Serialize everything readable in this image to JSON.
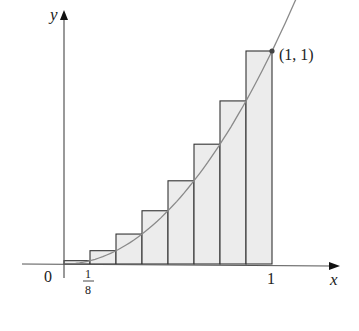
{
  "chart_data": {
    "type": "bar",
    "title": "",
    "function": "y = x^2",
    "xlabel": "x",
    "ylabel": "y",
    "xlim": [
      0,
      1
    ],
    "ylim": [
      0,
      1
    ],
    "n_rectangles": 8,
    "rectangle_width": 0.125,
    "categories": [
      "0–1/8",
      "1/8–2/8",
      "2/8–3/8",
      "3/8–4/8",
      "4/8–5/8",
      "5/8–6/8",
      "6/8–7/8",
      "7/8–1"
    ],
    "x_left": [
      0,
      0.125,
      0.25,
      0.375,
      0.5,
      0.625,
      0.75,
      0.875
    ],
    "values": [
      0.015625,
      0.0625,
      0.140625,
      0.25,
      0.390625,
      0.5625,
      0.765625,
      1.0
    ],
    "tick_labels": {
      "origin": "0",
      "x_tick_1_8": "1/8",
      "x_tick_1": "1"
    },
    "annotations": [
      {
        "text": "(1, 1)",
        "x": 1,
        "y": 1
      }
    ],
    "grid": false,
    "legend": null
  },
  "labels": {
    "y_axis": "y",
    "x_axis": "x",
    "origin": "0",
    "tick_one": "1",
    "frac_num": "1",
    "frac_den": "8",
    "point": "(1, 1)"
  },
  "colors": {
    "bar_fill": "#ececec",
    "bar_stroke": "#333333",
    "curve": "#8a8a8a",
    "axis": "#555555",
    "point": "#444444"
  }
}
